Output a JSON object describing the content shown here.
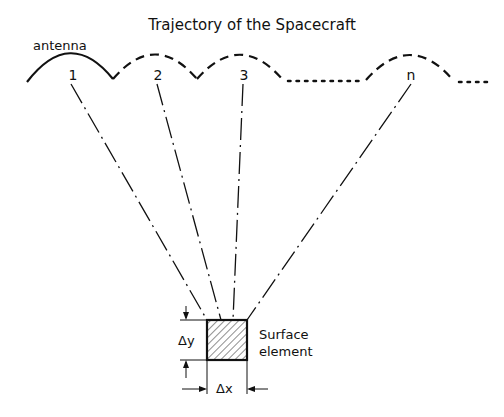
{
  "title": "Trajectory of the Spacecraft",
  "antenna_label": "antenna",
  "positions": [
    "1",
    "2",
    "3",
    "n"
  ],
  "surface_label_line1": "Surface",
  "surface_label_line2": "element",
  "dx_label": "Δx",
  "dy_label": "Δy",
  "colors": {
    "ink": "#111111",
    "background": "#ffffff"
  }
}
